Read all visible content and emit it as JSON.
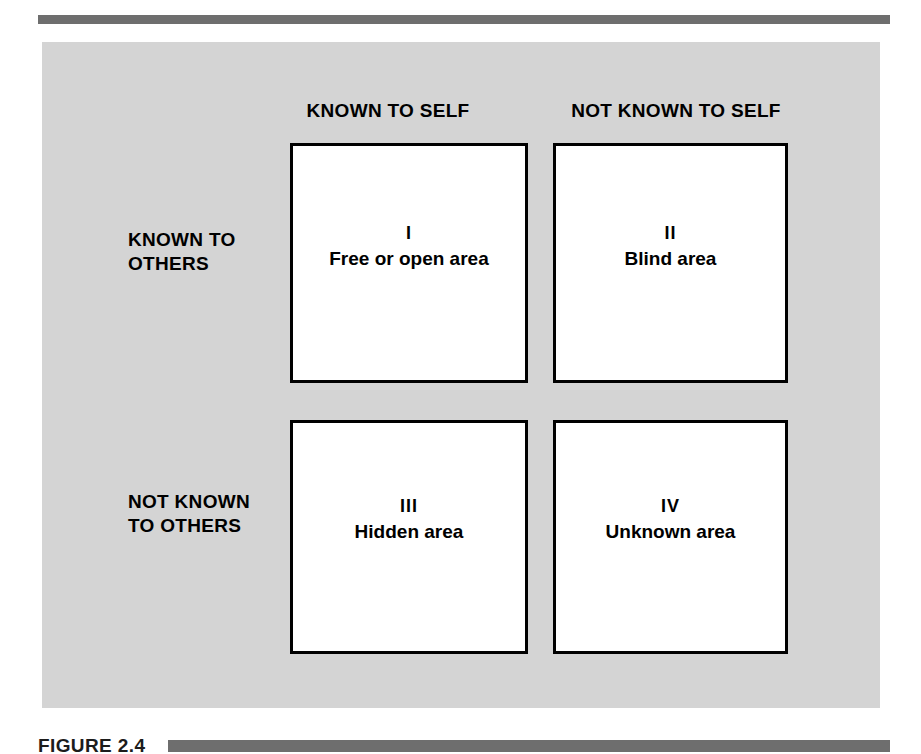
{
  "figure": {
    "top_rule": "decorative-rule",
    "caption_label": "FIGURE 2.4",
    "panel_color": "#d4d4d4",
    "rule_color": "#6e6e6e",
    "box_border_color": "#000000",
    "box_fill_color": "#ffffff"
  },
  "matrix": {
    "column_headers": [
      "KNOWN TO SELF",
      "NOT KNOWN TO SELF"
    ],
    "row_headers": [
      {
        "line1": "KNOWN TO",
        "line2": "OTHERS"
      },
      {
        "line1": "NOT KNOWN",
        "line2": "TO OTHERS"
      }
    ],
    "quadrants": [
      {
        "numeral": "I",
        "title": "Free or open area"
      },
      {
        "numeral": "II",
        "title": "Blind area"
      },
      {
        "numeral": "III",
        "title": "Hidden area"
      },
      {
        "numeral": "IV",
        "title": "Unknown area"
      }
    ]
  }
}
